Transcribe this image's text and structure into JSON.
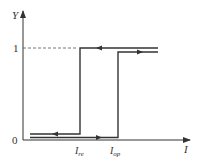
{
  "diagram": {
    "type": "relay-hysteresis-characteristic",
    "colors": {
      "line": "#333333",
      "dash": "#555555",
      "background": "#ffffff"
    },
    "axes": {
      "y_label": "Y",
      "x_label": "I",
      "origin_label": "0",
      "y_tick_label": "1"
    },
    "x_ticks": [
      {
        "main": "I",
        "sub": "re"
      },
      {
        "main": "I",
        "sub": "op"
      }
    ],
    "paths": [
      {
        "name": "pickup-path",
        "description": "increasing I: stays at 0 until I_op, then jumps to 1",
        "direction": "right"
      },
      {
        "name": "dropout-path",
        "description": "decreasing I: stays at 1 until I_re, then drops to 0",
        "direction": "left"
      }
    ]
  }
}
